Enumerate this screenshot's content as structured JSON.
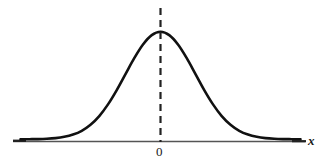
{
  "figure": {
    "background_color": "#ffffff",
    "width": 322,
    "height": 167,
    "curve_color": "#111111",
    "axis_color": "#555555",
    "dashed_line_color": "#222222"
  },
  "labels": {
    "origin": "0",
    "x_axis": "x"
  },
  "chart_data": {
    "type": "line",
    "title": "",
    "subtitle": "",
    "xlabel": "x",
    "ylabel": "",
    "grid": false,
    "legend": null,
    "xlim": [
      -4,
      4
    ],
    "ylim": [
      0,
      1
    ],
    "xticks": [
      0
    ],
    "xticklabels": [
      "0"
    ],
    "yticks": [],
    "yticklabels": [],
    "annotations": [
      {
        "name": "mean-dashed-line",
        "type": "vline",
        "x": 0,
        "style": "dashed",
        "label": "0"
      }
    ],
    "series": [
      {
        "name": "normal-density",
        "style": "solid",
        "x": [
          -4.0,
          -3.75,
          -3.5,
          -3.25,
          -3.0,
          -2.75,
          -2.5,
          -2.25,
          -2.0,
          -1.75,
          -1.5,
          -1.25,
          -1.0,
          -0.75,
          -0.5,
          -0.25,
          0.0,
          0.25,
          0.5,
          0.75,
          1.0,
          1.25,
          1.5,
          1.75,
          2.0,
          2.25,
          2.5,
          2.75,
          3.0,
          3.25,
          3.5,
          3.75,
          4.0
        ],
        "y": [
          0.0,
          0.001,
          0.002,
          0.005,
          0.011,
          0.023,
          0.044,
          0.079,
          0.135,
          0.216,
          0.325,
          0.458,
          0.607,
          0.755,
          0.882,
          0.969,
          1.0,
          0.969,
          0.882,
          0.755,
          0.607,
          0.458,
          0.325,
          0.216,
          0.135,
          0.079,
          0.044,
          0.023,
          0.011,
          0.005,
          0.002,
          0.001,
          0.0
        ]
      }
    ]
  }
}
